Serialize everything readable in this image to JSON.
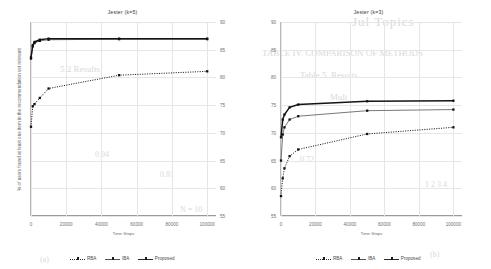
{
  "page": {
    "background_color": "#ffffff",
    "bleed_text": [
      "Jul Topics",
      "Table 5.  Results",
      "TABLE IV.  COMPARISON OF METHODS",
      "Mult",
      "5.2  Results",
      "0.94",
      "0.81",
      "0.72",
      "(a)",
      "(b)",
      "1 2 3 4",
      "N = 10"
    ]
  },
  "charts": [
    {
      "id": "jester-k5",
      "title": "Jester (k=5)",
      "chart_data": {
        "type": "line",
        "title": "Jester (k=5)",
        "xlabel": "Time Steps",
        "ylabel": "% of users found at least one item in the recommendation set relevant",
        "xlim": [
          0,
          105000
        ],
        "ylim": [
          55,
          90
        ],
        "xticks": [
          0,
          20000,
          40000,
          60000,
          80000,
          100000
        ],
        "xticklabels": [
          "0",
          "20000",
          "40000",
          "60000",
          "80000",
          "100000"
        ],
        "yticks": [
          55,
          60,
          65,
          70,
          75,
          80,
          85,
          90
        ],
        "yticklabels": [
          "55",
          "60",
          "65",
          "70",
          "75",
          "80",
          "85",
          "90"
        ],
        "grid": true,
        "yaxis_position": "right",
        "legend_position": "bottom",
        "x": [
          0,
          1000,
          2000,
          5000,
          10000,
          50000,
          100000
        ],
        "series": [
          {
            "name": "RBA",
            "style": "dotted",
            "marker": "square",
            "values": [
              71.1,
              74.8,
              75.2,
              76.3,
              78.0,
              80.4,
              81.1
            ]
          },
          {
            "name": "IBA",
            "style": "thin-solid",
            "marker": "square",
            "values": [
              83.4,
              85.6,
              86.2,
              86.6,
              86.8,
              86.9,
              86.9
            ]
          },
          {
            "name": "Proposed",
            "style": "thick-solid",
            "marker": "square",
            "values": [
              83.6,
              85.8,
              86.4,
              86.8,
              87.0,
              87.0,
              87.0
            ]
          }
        ]
      }
    },
    {
      "id": "jester-k3",
      "title": "Jester (k=3)",
      "chart_data": {
        "type": "line",
        "title": "Jester (k=3)",
        "xlabel": "Time Steps",
        "ylabel": "",
        "xlim": [
          0,
          105000
        ],
        "ylim": [
          55,
          90
        ],
        "xticks": [
          0,
          20000,
          40000,
          60000,
          80000,
          100000
        ],
        "xticklabels": [
          "0",
          "20000",
          "40000",
          "60000",
          "80000",
          "100000"
        ],
        "yticks": [
          55,
          60,
          65,
          70,
          75,
          80,
          85,
          90
        ],
        "yticklabels": [
          "55",
          "60",
          "65",
          "70",
          "75",
          "80",
          "85",
          "90"
        ],
        "grid": true,
        "yaxis_position": "left",
        "legend_position": "bottom",
        "x": [
          0,
          1000,
          2000,
          5000,
          10000,
          50000,
          100000
        ],
        "series": [
          {
            "name": "RBA",
            "style": "dotted",
            "marker": "square",
            "values": [
              58.6,
              61.8,
              63.6,
              65.8,
              67.0,
              69.8,
              71.0
            ]
          },
          {
            "name": "IBA",
            "style": "thin-solid",
            "marker": "square",
            "values": [
              65.0,
              69.7,
              71.0,
              72.4,
              73.0,
              74.0,
              74.2
            ]
          },
          {
            "name": "Proposed",
            "style": "thick-solid",
            "marker": "square",
            "values": [
              69.2,
              72.4,
              73.3,
              74.6,
              75.1,
              75.7,
              75.8
            ]
          }
        ]
      }
    }
  ],
  "legend": {
    "items": [
      {
        "label": "RBA",
        "style": "dotted"
      },
      {
        "label": "IBA",
        "style": "thin"
      },
      {
        "label": "Proposed",
        "style": "thick"
      }
    ]
  }
}
